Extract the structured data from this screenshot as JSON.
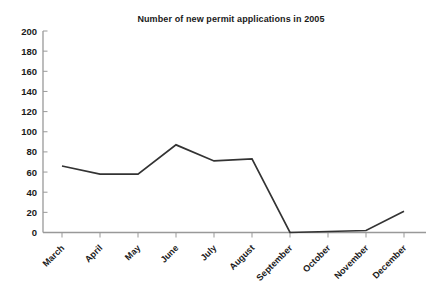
{
  "chart_data": {
    "type": "line",
    "title": "Number of new permit applications in 2005",
    "categories": [
      "March",
      "April",
      "May",
      "June",
      "July",
      "August",
      "September",
      "October",
      "November",
      "December"
    ],
    "values": [
      66,
      58,
      58,
      87,
      71,
      73,
      0,
      1,
      2,
      21
    ],
    "xlabel": "",
    "ylabel": "",
    "ylim": [
      0,
      200
    ],
    "ytick_step": 20,
    "grid": false,
    "legend": "none"
  },
  "colors": {
    "line": "#333333",
    "axis": "#999999",
    "text": "#1a1a1a",
    "background": "#ffffff"
  }
}
